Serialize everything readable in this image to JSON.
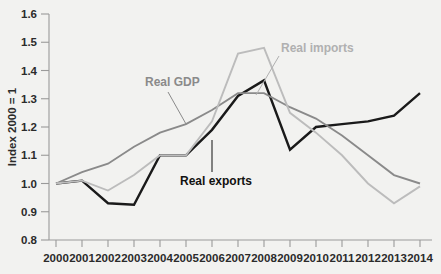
{
  "chart_data": {
    "type": "line",
    "title": "",
    "subtitle": "",
    "xlabel": "",
    "ylabel": "Index 2000 = 1",
    "categories": [
      "2000",
      "2001",
      "2002",
      "2003",
      "2004",
      "2005",
      "2006",
      "2007",
      "2008",
      "2009",
      "2010",
      "2011",
      "2012",
      "2013",
      "2014"
    ],
    "x": [
      2000,
      2001,
      2002,
      2003,
      2004,
      2005,
      2006,
      2007,
      2008,
      2009,
      2010,
      2011,
      2012,
      2013,
      2014
    ],
    "xlim": [
      2000,
      2014
    ],
    "ylim": [
      0.8,
      1.6
    ],
    "yticks": [
      "0.8",
      "0.9",
      "1.0",
      "1.1",
      "1.2",
      "1.3",
      "1.4",
      "1.5",
      "1.6"
    ],
    "ytick_values": [
      0.8,
      0.9,
      1.0,
      1.1,
      1.2,
      1.3,
      1.4,
      1.5,
      1.6
    ],
    "grid": false,
    "legend_position": "inline-annotations",
    "series": [
      {
        "name": "Real exports",
        "color": "#1a1a1a",
        "width": 2.4,
        "values": [
          1.0,
          1.01,
          0.93,
          0.925,
          1.1,
          1.1,
          1.19,
          1.31,
          1.365,
          1.12,
          1.2,
          1.21,
          1.22,
          1.24,
          1.32
        ]
      },
      {
        "name": "Real GDP",
        "color": "#8a8a8a",
        "width": 1.9,
        "values": [
          1.0,
          1.04,
          1.07,
          1.13,
          1.18,
          1.21,
          1.26,
          1.32,
          1.32,
          1.27,
          1.23,
          1.17,
          1.1,
          1.03,
          1.0
        ]
      },
      {
        "name": "Real imports",
        "color": "#bcbcbc",
        "width": 1.9,
        "values": [
          1.0,
          1.01,
          0.975,
          1.03,
          1.1,
          1.1,
          1.22,
          1.46,
          1.48,
          1.25,
          1.18,
          1.1,
          1.0,
          0.93,
          0.99
        ]
      }
    ],
    "annotations": [
      {
        "text": "Real GDP",
        "color": "#8a8a8a",
        "text_x": 145,
        "text_y": 86,
        "anchor": "start",
        "leader": {
          "x1": 168,
          "y1": 92,
          "x2": 186,
          "y2": 124
        }
      },
      {
        "text": "Real imports",
        "color": "#b0b0b0",
        "text_x": 281,
        "text_y": 52,
        "anchor": "start",
        "leader": {
          "x1": 279,
          "y1": 56,
          "x2": 256,
          "y2": 95
        }
      },
      {
        "text": "Real exports",
        "color": "#111111",
        "text_x": 180,
        "text_y": 185,
        "anchor": "start",
        "leader": {
          "x1": 212,
          "y1": 172,
          "x2": 212,
          "y2": 140
        }
      }
    ]
  },
  "axis": {
    "y_title": "Index 2000 = 1",
    "x_tick_labels": [
      "2000",
      "2001",
      "2002",
      "2003",
      "2004",
      "2005",
      "2006",
      "2007",
      "2008",
      "2009",
      "2010",
      "2011",
      "2012",
      "2013",
      "2014"
    ],
    "y_tick_labels": [
      "1.6",
      "1.5",
      "1.4",
      "1.3",
      "1.2",
      "1.1",
      "1.0",
      "0.9",
      "0.8"
    ],
    "axis_color": "#9a9a9a",
    "text_color": "#2b2b2b",
    "background": "#f2f2f0"
  }
}
